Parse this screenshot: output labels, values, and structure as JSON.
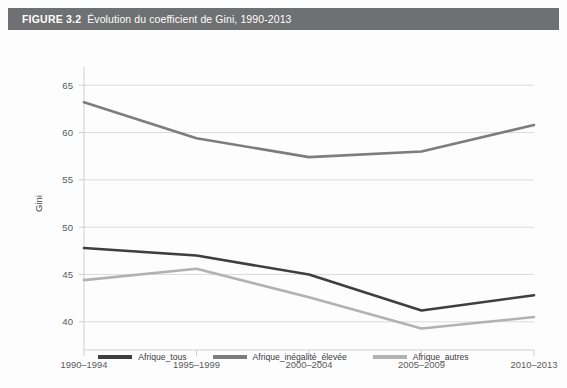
{
  "figure": {
    "number_label": "FIGURE 3.2",
    "title": "Évolution du coefficient de Gini, 1990-2013",
    "header_bg": "#6f7072",
    "header_text_color": "#ffffff"
  },
  "chart_data": {
    "type": "line",
    "title": "Évolution du coefficient de Gini, 1990-2013",
    "xlabel": "",
    "ylabel": "Gini",
    "categories": [
      "1990–1994",
      "1995–1999",
      "2000–2004",
      "2005–2009",
      "2010–2013"
    ],
    "ylim": [
      38.5,
      66.5
    ],
    "yticks": [
      40,
      45,
      50,
      55,
      60,
      65
    ],
    "ytick_labels": [
      "40",
      "45",
      "50",
      "55",
      "60",
      "65"
    ],
    "grid": "horizontal",
    "legend_position": "bottom-center",
    "series": [
      {
        "name": "Afrique_tous",
        "color": "#3f3f3f",
        "values": [
          47.8,
          47.0,
          45.0,
          41.2,
          42.8
        ]
      },
      {
        "name": "Afrique_inégalité_élevée",
        "color": "#7d7d7d",
        "values": [
          63.2,
          59.4,
          57.4,
          58.0,
          60.8
        ]
      },
      {
        "name": "Afrique_autres",
        "color": "#b2b2b2",
        "values": [
          44.4,
          45.6,
          42.6,
          39.3,
          40.5
        ]
      }
    ]
  },
  "axis": {
    "y_title": "Gini"
  }
}
